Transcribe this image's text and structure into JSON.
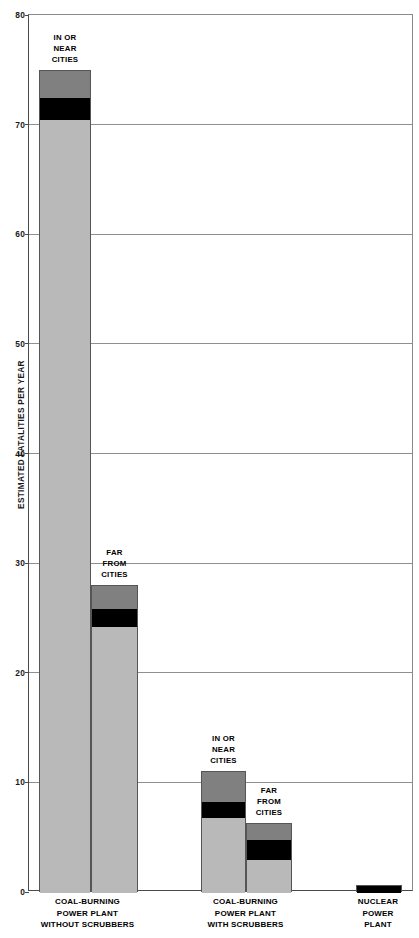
{
  "chart_data": {
    "type": "bar",
    "title": "",
    "subtitle": "",
    "xlabel": "",
    "ylabel": "ESTIMATED FATALITIES PER YEAR",
    "ylim": [
      0,
      80
    ],
    "yticks": [
      0,
      10,
      20,
      30,
      40,
      50,
      60,
      70,
      80
    ],
    "ytick_labels": [
      "0",
      "10",
      "20",
      "30",
      "40",
      "50",
      "60",
      "70",
      "80"
    ],
    "grid": true,
    "legend_position": "none",
    "stacked": true,
    "segment_names": [
      "lower-estimate",
      "mid-band",
      "upper-estimate"
    ],
    "segment_colors": [
      "#b9b9b9",
      "#000000",
      "#808080"
    ],
    "categories": [
      "COAL-BURNING POWER PLANT WITHOUT SCRUBBERS",
      "COAL-BURNING POWER PLANT WITH SCRUBBERS",
      "NUCLEAR POWER PLANT"
    ],
    "bars": [
      {
        "group": "COAL-BURNING POWER PLANT WITHOUT SCRUBBERS",
        "annotation": "IN OR\nNEAR\nCITIES",
        "total": 75.0,
        "segments": [
          {
            "name": "lower-estimate",
            "from": 0.0,
            "to": 70.5,
            "color": "#b9b9b9"
          },
          {
            "name": "mid-band",
            "from": 70.5,
            "to": 72.5,
            "color": "#000000"
          },
          {
            "name": "upper-estimate",
            "from": 72.5,
            "to": 75.0,
            "color": "#808080"
          }
        ]
      },
      {
        "group": "COAL-BURNING POWER PLANT WITHOUT SCRUBBERS",
        "annotation": "FAR\nFROM\nCITIES",
        "total": 28.0,
        "segments": [
          {
            "name": "lower-estimate",
            "from": 0.0,
            "to": 24.3,
            "color": "#b9b9b9"
          },
          {
            "name": "mid-band",
            "from": 24.3,
            "to": 25.9,
            "color": "#000000"
          },
          {
            "name": "upper-estimate",
            "from": 25.9,
            "to": 28.0,
            "color": "#808080"
          }
        ]
      },
      {
        "group": "COAL-BURNING POWER PLANT WITH SCRUBBERS",
        "annotation": "IN OR\nNEAR\nCITIES",
        "total": 11.0,
        "segments": [
          {
            "name": "lower-estimate",
            "from": 0.0,
            "to": 6.8,
            "color": "#b9b9b9"
          },
          {
            "name": "mid-band",
            "from": 6.8,
            "to": 8.3,
            "color": "#000000"
          },
          {
            "name": "upper-estimate",
            "from": 8.3,
            "to": 11.0,
            "color": "#808080"
          }
        ]
      },
      {
        "group": "COAL-BURNING POWER PLANT WITH SCRUBBERS",
        "annotation": "FAR\nFROM\nCITIES",
        "total": 6.3,
        "segments": [
          {
            "name": "lower-estimate",
            "from": 0.0,
            "to": 3.0,
            "color": "#b9b9b9"
          },
          {
            "name": "mid-band",
            "from": 3.0,
            "to": 4.8,
            "color": "#000000"
          },
          {
            "name": "upper-estimate",
            "from": 4.8,
            "to": 6.3,
            "color": "#808080"
          }
        ]
      },
      {
        "group": "NUCLEAR POWER PLANT",
        "annotation": "",
        "total": 0.65,
        "segments": [
          {
            "name": "mid-band",
            "from": 0.0,
            "to": 0.65,
            "color": "#000000"
          }
        ]
      }
    ]
  },
  "axis": {
    "y_title": "ESTIMATED FATALITIES PER YEAR",
    "ticks": [
      {
        "value": 80,
        "label": "80"
      },
      {
        "value": 70,
        "label": "70"
      },
      {
        "value": 60,
        "label": "60"
      },
      {
        "value": 50,
        "label": "50"
      },
      {
        "value": 40,
        "label": "40"
      },
      {
        "value": 30,
        "label": "30"
      },
      {
        "value": 20,
        "label": "20"
      },
      {
        "value": 10,
        "label": "10"
      },
      {
        "value": 0,
        "label": "0"
      }
    ]
  },
  "annotations": {
    "bar1": "IN OR\nNEAR\nCITIES",
    "bar2": "FAR\nFROM\nCITIES",
    "bar3": "IN OR\nNEAR\nCITIES",
    "bar4": "FAR\nFROM\nCITIES"
  },
  "category_labels": {
    "group1": "COAL-BURNING\nPOWER PLANT\nWITHOUT SCRUBBERS",
    "group2": "COAL-BURNING\nPOWER PLANT\nWITH SCRUBBERS",
    "group3": "NUCLEAR\nPOWER\nPLANT"
  },
  "colors": {
    "light_gray": "#b9b9b9",
    "mid_gray": "#808080",
    "black": "#000000",
    "grid": "#8f8f8f",
    "axis": "#4a4a4a"
  }
}
